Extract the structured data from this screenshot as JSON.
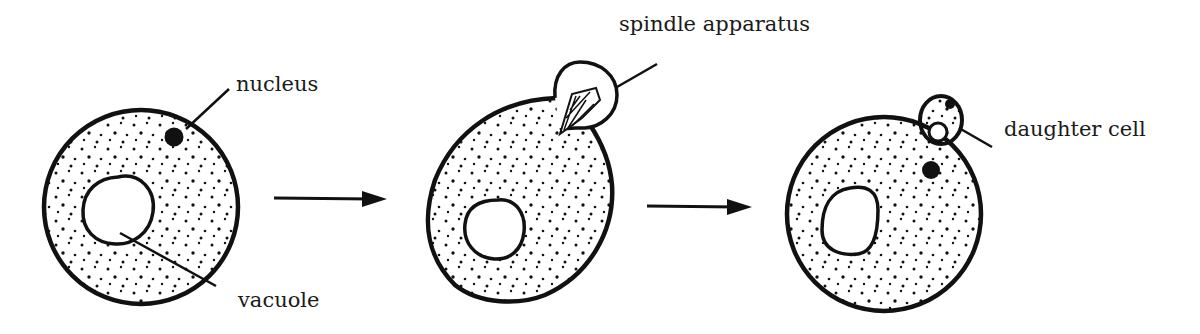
{
  "labels": {
    "nucleus": "nucleus",
    "vacuole": "vacuole",
    "spindle": "spindle apparatus",
    "daughter": "daughter cell"
  },
  "stages": [
    {
      "name": "parent cell with nucleus and vacuole"
    },
    {
      "name": "bud forms with spindle apparatus"
    },
    {
      "name": "daughter cell formed"
    }
  ],
  "colors": {
    "ink": "#111111",
    "background": "#ffffff"
  }
}
